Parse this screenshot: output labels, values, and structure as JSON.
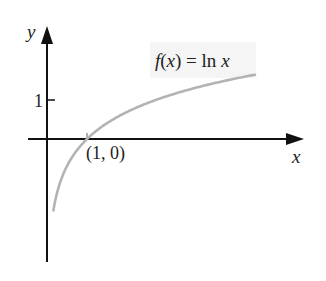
{
  "chart_data": {
    "type": "line",
    "title": "",
    "function_label": "f(x) = ln x",
    "xlabel": "x",
    "ylabel": "y",
    "yticks": [
      {
        "value": 1,
        "label": "1"
      }
    ],
    "annotations": [
      {
        "x": 1,
        "y": 0,
        "label": "(1, 0)"
      }
    ],
    "series": [
      {
        "name": "f(x) = ln x",
        "expr": "ln(x)",
        "color": "#b3b3b3",
        "x_range": [
          0.16,
          5.2
        ]
      }
    ],
    "xlim": [
      -0.5,
      6.4
    ],
    "ylim": [
      -3.1,
      2.8
    ],
    "grid": false,
    "legend": "none"
  },
  "colors": {
    "axis": "#111111",
    "curve": "#b3b3b3",
    "text": "#222222",
    "label_bg": "#f5f5f5"
  },
  "layout": {
    "origin_px": [
      47,
      139
    ],
    "px_per_unit_x": 40,
    "px_per_unit_y": 39
  }
}
